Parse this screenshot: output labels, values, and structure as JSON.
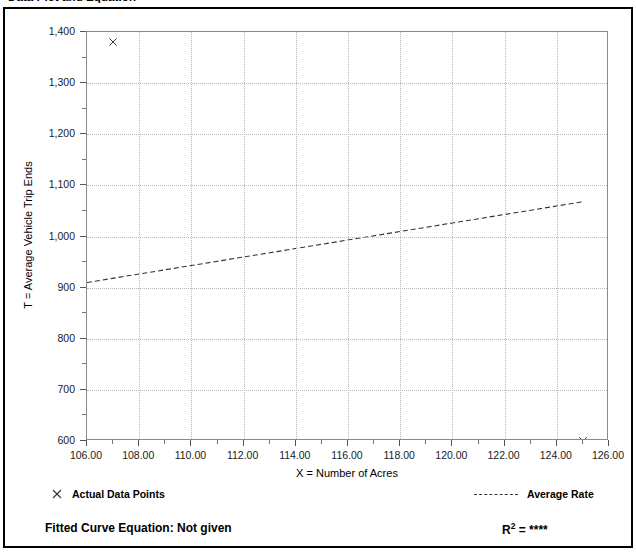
{
  "header": {
    "title": "Data Plot and Equation",
    "right_text": ""
  },
  "chart_data": {
    "type": "scatter",
    "title": "Data Plot and Equation",
    "xlabel": "X = Number of Acres",
    "ylabel": "T = Average Vehicle Trip Ends",
    "xlim": [
      106,
      126
    ],
    "ylim": [
      600,
      1400
    ],
    "xticks": [
      "106.00",
      "108.00",
      "110.00",
      "112.00",
      "114.00",
      "116.00",
      "118.00",
      "120.00",
      "122.00",
      "124.00",
      "126.00"
    ],
    "xtick_values": [
      106,
      108,
      110,
      112,
      114,
      116,
      118,
      120,
      122,
      124,
      126
    ],
    "yticks": [
      "600",
      "700",
      "800",
      "900",
      "1,000",
      "1,100",
      "1,200",
      "1,300",
      "1,400"
    ],
    "ytick_values": [
      600,
      700,
      800,
      900,
      1000,
      1100,
      1200,
      1300,
      1400
    ],
    "grid": true,
    "series": [
      {
        "name": "Actual Data Points",
        "type": "scatter",
        "marker": "x",
        "points": [
          {
            "x": 107.0,
            "y": 1380
          },
          {
            "x": 125.0,
            "y": 600
          }
        ]
      },
      {
        "name": "Average Rate",
        "type": "line",
        "style": "dashed",
        "points": [
          {
            "x": 106.0,
            "y": 910
          },
          {
            "x": 125.0,
            "y": 1068
          }
        ]
      }
    ],
    "legend_position": "below-axes"
  },
  "legend": {
    "data_points_label": "Actual Data Points",
    "average_rate_label": "Average Rate",
    "marker_icon": "x-marker-icon",
    "line_icon": "dashed-line-icon"
  },
  "equation": {
    "label": "Fitted Curve Equation:",
    "value": "Not given",
    "full_text": "Fitted Curve Equation:  Not given",
    "r_squared_prefix": "R",
    "r_squared_exponent": "2",
    "r_squared_equals": " = ",
    "r_squared_value": "****"
  },
  "colors": {
    "frame": "#000000",
    "plot_border": "#8a8a8a",
    "gridline": "#b9b9b9",
    "marker": "#333333",
    "trend_line": "#333333",
    "text": "#000000"
  }
}
